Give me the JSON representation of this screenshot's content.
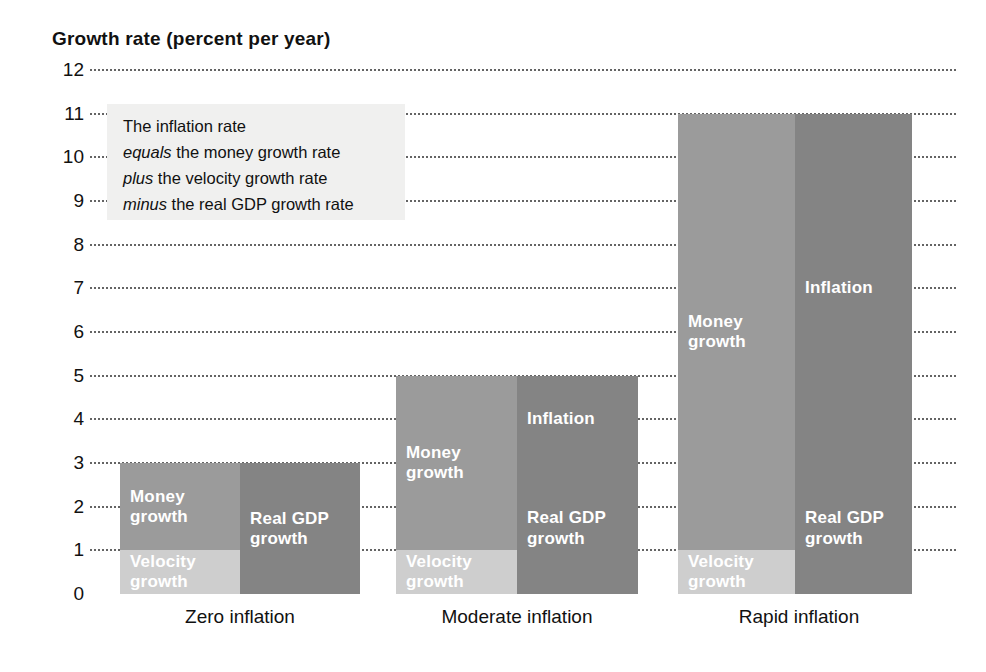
{
  "chart_data": {
    "type": "bar",
    "title": "Growth rate (percent per year)",
    "xlabel": "",
    "ylabel": "Growth rate (percent per year)",
    "ylim": [
      0,
      12
    ],
    "yticks": [
      12,
      11,
      10,
      9,
      8,
      7,
      6,
      5,
      4,
      3,
      2,
      1,
      0
    ],
    "ytick_labels": [
      "12",
      "11",
      "10",
      "9",
      "8",
      "7",
      "6",
      "5",
      "4",
      "3",
      "2",
      "1",
      "0"
    ],
    "grid": true,
    "grid_style": "dotted horizontal",
    "legend": "in-bar labels",
    "categories": [
      "Zero inflation",
      "Moderate inflation",
      "Rapid inflation"
    ],
    "stacked": true,
    "pairs": [
      {
        "category": "Zero inflation",
        "left_bar": {
          "name": "sources",
          "segments": [
            {
              "label": "Velocity growth",
              "value": 1,
              "from": 0,
              "to": 1,
              "color": "#cecece"
            },
            {
              "label": "Money growth",
              "value": 2,
              "from": 1,
              "to": 3,
              "color": "#9b9b9b"
            }
          ],
          "total": 3
        },
        "right_bar": {
          "name": "uses",
          "segments": [
            {
              "label": "Real GDP growth",
              "value": 3,
              "from": 0,
              "to": 3,
              "color": "#848484"
            }
          ],
          "total": 3
        }
      },
      {
        "category": "Moderate inflation",
        "left_bar": {
          "name": "sources",
          "segments": [
            {
              "label": "Velocity growth",
              "value": 1,
              "from": 0,
              "to": 1,
              "color": "#cecece"
            },
            {
              "label": "Money growth",
              "value": 4,
              "from": 1,
              "to": 5,
              "color": "#9b9b9b"
            }
          ],
          "total": 5
        },
        "right_bar": {
          "name": "uses",
          "segments": [
            {
              "label": "Real GDP growth",
              "value": 3,
              "from": 0,
              "to": 3,
              "color": "#848484"
            },
            {
              "label": "Inflation",
              "value": 2,
              "from": 3,
              "to": 5,
              "color": "#848484"
            }
          ],
          "total": 5
        }
      },
      {
        "category": "Rapid inflation",
        "left_bar": {
          "name": "sources",
          "segments": [
            {
              "label": "Velocity growth",
              "value": 1,
              "from": 0,
              "to": 1,
              "color": "#cecece"
            },
            {
              "label": "Money growth",
              "value": 10,
              "from": 1,
              "to": 11,
              "color": "#9b9b9b"
            }
          ],
          "total": 11
        },
        "right_bar": {
          "name": "uses",
          "segments": [
            {
              "label": "Real GDP growth",
              "value": 3,
              "from": 0,
              "to": 3,
              "color": "#848484"
            },
            {
              "label": "Inflation",
              "value": 8,
              "from": 3,
              "to": 11,
              "color": "#848484"
            }
          ],
          "total": 11
        }
      }
    ],
    "annotation": {
      "lines": [
        {
          "emphasis": "",
          "text": "The inflation rate"
        },
        {
          "emphasis": "equals",
          "text": " the money growth rate"
        },
        {
          "emphasis": "plus",
          "text": " the velocity growth rate"
        },
        {
          "emphasis": "minus",
          "text": " the real GDP growth rate"
        }
      ]
    },
    "colors": {
      "money_growth": "#9b9b9b",
      "velocity_growth": "#cecece",
      "inflation": "#848484",
      "real_gdp_growth": "#848484",
      "annotation_background": "#f0f0ef",
      "grid": "#4a4a4a",
      "text": "#111111",
      "bar_label_text": "#ffffff",
      "page_background": "#ffffff"
    }
  },
  "labels": {
    "title": "Growth rate (percent per year)"
  }
}
